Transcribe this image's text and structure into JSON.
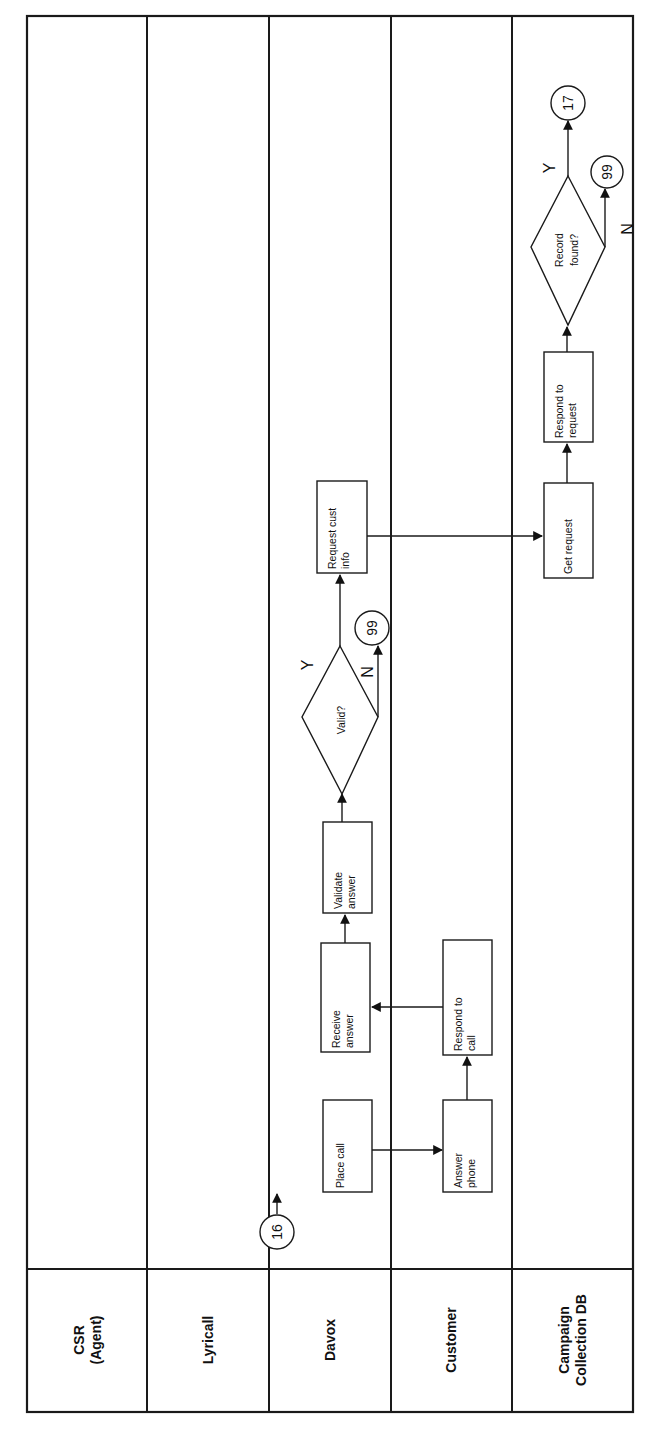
{
  "diagram": {
    "type": "cross-functional swimlane flowchart (rotated 90°)",
    "lanes": [
      {
        "id": "csr",
        "label_line1": "CSR",
        "label_line2": "(Agent)"
      },
      {
        "id": "lyricall",
        "label_line1": "Lyricall"
      },
      {
        "id": "davox",
        "label_line1": "Davox"
      },
      {
        "id": "customer",
        "label_line1": "Customer"
      },
      {
        "id": "campaign",
        "label_line1": "Campaign",
        "label_line2": "Collection DB"
      }
    ],
    "nodes": {
      "c16": {
        "type": "connector",
        "label": "16",
        "lane": "davox"
      },
      "place_call": {
        "type": "process",
        "line1": "Place call",
        "lane": "davox"
      },
      "answer_phone": {
        "type": "process",
        "line1": "Answer",
        "line2": "phone",
        "lane": "customer"
      },
      "respond_call": {
        "type": "process",
        "line1": "Respond to",
        "line2": "call",
        "lane": "customer"
      },
      "receive_answer": {
        "type": "process",
        "line1": "Receive",
        "line2": "answer",
        "lane": "davox"
      },
      "validate_answer": {
        "type": "process",
        "line1": "Validate",
        "line2": "answer",
        "lane": "davox"
      },
      "valid": {
        "type": "decision",
        "line1": "Valid?",
        "lane": "davox"
      },
      "c99a": {
        "type": "connector",
        "label": "99",
        "lane": "davox"
      },
      "request_cust_info": {
        "type": "process",
        "line1": "Request cust",
        "line2": "info",
        "lane": "davox"
      },
      "get_request": {
        "type": "process",
        "line1": "Get request",
        "lane": "campaign"
      },
      "respond_request": {
        "type": "process",
        "line1": "Respond to",
        "line2": "request",
        "lane": "campaign"
      },
      "record_found": {
        "type": "decision",
        "line1": "Record",
        "line2": "found?",
        "lane": "campaign"
      },
      "c99b": {
        "type": "connector",
        "label": "99",
        "lane": "campaign"
      },
      "c17": {
        "type": "connector",
        "label": "17",
        "lane": "campaign"
      }
    },
    "branches": {
      "valid_yes": "Y",
      "valid_no": "N",
      "record_yes": "Y",
      "record_no": "N"
    },
    "edges": [
      {
        "from": "c16",
        "to": "place_call"
      },
      {
        "from": "place_call",
        "to": "answer_phone"
      },
      {
        "from": "answer_phone",
        "to": "respond_call"
      },
      {
        "from": "respond_call",
        "to": "receive_answer"
      },
      {
        "from": "receive_answer",
        "to": "validate_answer"
      },
      {
        "from": "validate_answer",
        "to": "valid"
      },
      {
        "from": "valid",
        "to": "request_cust_info",
        "label": "Y"
      },
      {
        "from": "valid",
        "to": "c99a",
        "label": "N"
      },
      {
        "from": "request_cust_info",
        "to": "get_request"
      },
      {
        "from": "get_request",
        "to": "respond_request"
      },
      {
        "from": "respond_request",
        "to": "record_found"
      },
      {
        "from": "record_found",
        "to": "c17",
        "label": "Y"
      },
      {
        "from": "record_found",
        "to": "c99b",
        "label": "N"
      }
    ]
  }
}
